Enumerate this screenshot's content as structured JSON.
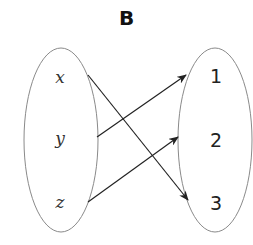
{
  "title": "B",
  "domain": {
    "elements": [
      "x",
      "y",
      "z"
    ]
  },
  "codomain": {
    "elements": [
      "1",
      "2",
      "3"
    ]
  },
  "mappings": [
    {
      "from": "x",
      "to": "3"
    },
    {
      "from": "y",
      "to": "1"
    },
    {
      "from": "z",
      "to": "2"
    }
  ],
  "colors": {
    "ellipse_stroke": "#8a8a8a",
    "arrow": "#222222"
  }
}
